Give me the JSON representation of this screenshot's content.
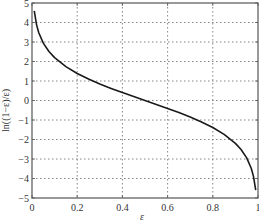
{
  "chart_data": {
    "type": "line",
    "title": "",
    "xlabel": "ε",
    "ylabel": "ln((1−ε)/ε)",
    "xlim": [
      0,
      1
    ],
    "ylim": [
      -5,
      5
    ],
    "grid": true,
    "legend": null,
    "x_ticks": [
      0,
      0.2,
      0.4,
      0.6,
      0.8,
      1
    ],
    "x_tick_labels": [
      "0",
      "0.2",
      "0.4",
      "0.6",
      "0.8",
      "1"
    ],
    "y_ticks": [
      -5,
      -4,
      -3,
      -2,
      -1,
      0,
      1,
      2,
      3,
      4,
      5
    ],
    "y_tick_labels": [
      "−5",
      "−4",
      "−3",
      "−2",
      "−1",
      "0",
      "1",
      "2",
      "3",
      "4",
      "5"
    ],
    "series": [
      {
        "name": "ln((1−ε)/ε)",
        "color": "#1a1a1a",
        "x": [
          0.01,
          0.02,
          0.03,
          0.05,
          0.075,
          0.1,
          0.15,
          0.2,
          0.25,
          0.3,
          0.35,
          0.4,
          0.45,
          0.5,
          0.55,
          0.6,
          0.65,
          0.7,
          0.75,
          0.8,
          0.85,
          0.9,
          0.925,
          0.95,
          0.97,
          0.98,
          0.99
        ],
        "y": [
          4.595,
          3.892,
          3.476,
          2.944,
          2.512,
          2.197,
          1.735,
          1.386,
          1.099,
          0.847,
          0.619,
          0.405,
          0.201,
          0.0,
          -0.201,
          -0.405,
          -0.619,
          -0.847,
          -1.099,
          -1.386,
          -1.735,
          -2.197,
          -2.512,
          -2.944,
          -3.476,
          -3.892,
          -4.595
        ]
      }
    ]
  },
  "colors": {
    "axis": "#555555",
    "grid": "#666666",
    "curve": "#1a1a1a",
    "text": "#333333"
  }
}
